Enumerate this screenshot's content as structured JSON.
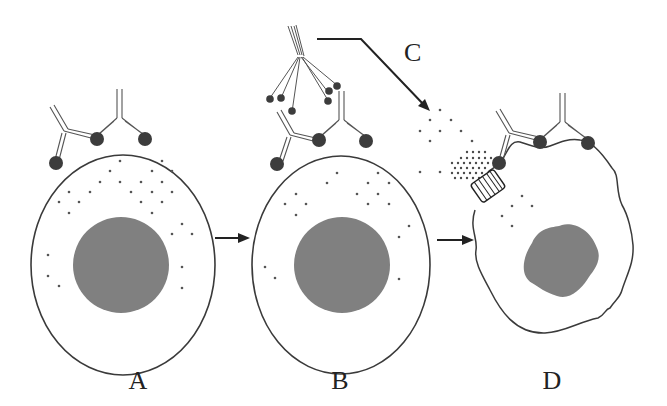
{
  "figure": {
    "type": "diagram",
    "colors": {
      "outline": "#3a3a3a",
      "nucleus": "#808080",
      "antigen": "#3c3c3c",
      "granule": "#555555",
      "background": "#ffffff"
    }
  },
  "panels": [
    {
      "id": "A",
      "label": "A",
      "state": "intact cell with antibodies bound to surface antigens"
    },
    {
      "id": "B",
      "label": "B",
      "state": "complement C1q binds antibody Fc regions"
    },
    {
      "id": "D",
      "label": "D",
      "state": "lysed cell with membrane pore and leaking contents"
    }
  ],
  "step_label": {
    "id": "C",
    "label": "C",
    "state": "membrane attack complex pore formation"
  },
  "arrows": [
    {
      "from": "A",
      "to": "B"
    },
    {
      "from": "B",
      "to": "D"
    },
    {
      "from": "C-complement",
      "to": "D-pore"
    }
  ]
}
